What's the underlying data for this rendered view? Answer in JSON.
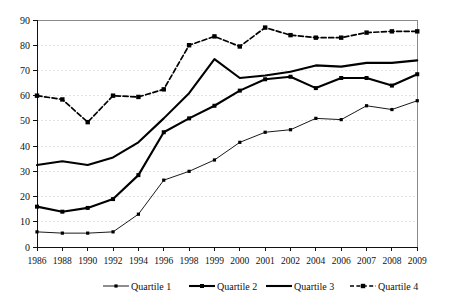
{
  "chart_data": {
    "type": "line",
    "title": "",
    "subtitle": "",
    "xlabel": "",
    "ylabel": "",
    "grid": true,
    "legend_position": "bottom",
    "ylim": [
      0,
      90
    ],
    "yticks": [
      0,
      10,
      20,
      30,
      40,
      50,
      60,
      70,
      80,
      90
    ],
    "categories": [
      "1986",
      "1988",
      "1990",
      "1992",
      "1994",
      "1996",
      "1998",
      "1999",
      "2000",
      "2001",
      "2002",
      "2004",
      "2006",
      "2007",
      "2008",
      "2009"
    ],
    "series": [
      {
        "name": "Quartile 1",
        "style": "thin-solid-marker",
        "values": [
          6,
          5.5,
          5.5,
          6,
          13,
          26.5,
          30,
          34.5,
          41.5,
          45.5,
          46.5,
          51,
          50.5,
          56,
          54.5,
          58
        ]
      },
      {
        "name": "Quartile 2",
        "style": "thick-solid-marker",
        "values": [
          16,
          14,
          15.5,
          19,
          28.5,
          45.5,
          51,
          56,
          62,
          66.5,
          67.5,
          63,
          67,
          67,
          64,
          68.5
        ]
      },
      {
        "name": "Quartile 3",
        "style": "thick-solid-plain",
        "values": [
          32.5,
          34,
          32.5,
          35.5,
          41.5,
          51,
          61,
          74.5,
          67,
          68,
          69.5,
          72,
          71.5,
          73,
          73,
          74
        ]
      },
      {
        "name": "Quartile 4",
        "style": "dashed-marker",
        "values": [
          60,
          58.5,
          49.5,
          60,
          59.5,
          62.5,
          80,
          83.5,
          79.5,
          87,
          84,
          83,
          83,
          85,
          85.5,
          85.5
        ]
      }
    ]
  },
  "legend": {
    "items": [
      {
        "label": "Quartile 1"
      },
      {
        "label": "Quartile 2"
      },
      {
        "label": "Quartile 3"
      },
      {
        "label": "Quartile 4"
      }
    ]
  },
  "colors": {
    "series": "#000000",
    "grid": "#dcdcdc",
    "axis": "#111111",
    "frame": "#8a8a8a",
    "background": "#ffffff"
  }
}
